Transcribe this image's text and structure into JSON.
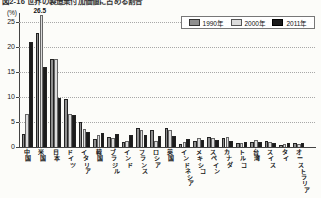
{
  "figure": {
    "title": "図2-16 世界の製造業付加価値に占める割合",
    "unit_label": "(%)"
  },
  "annotation": {
    "text": "26.5",
    "category": "米国",
    "series": "2000年"
  },
  "legend": {
    "items": [
      {
        "label": "1990年",
        "color": "#8f8f8f",
        "border": "#333333"
      },
      {
        "label": "2000年",
        "color": "#dcdcdc",
        "border": "#555555"
      },
      {
        "label": "2011年",
        "color": "#1b1b1b",
        "border": "#000000"
      }
    ]
  },
  "chart_data": {
    "type": "bar",
    "title": "世界の製造業付加価値に占める割合",
    "ylabel": "(%)",
    "ylim": [
      0,
      27.5
    ],
    "y_ticks": [
      0,
      5,
      10,
      15,
      20,
      25
    ],
    "grid": "dotted-horizontal",
    "legend_position": "top-right",
    "categories": [
      "中国",
      "米国",
      "日本",
      "ドイツ",
      "イタリア",
      "韓国",
      "ブラジル",
      "インド",
      "フランス",
      "ロシア",
      "英国",
      "インドネシア",
      "メキシコ",
      "スペイン",
      "カナダ",
      "トルコ",
      "台湾",
      "スイス",
      "タイ",
      "オーストラリア"
    ],
    "series": [
      {
        "name": "1990年",
        "color": "#8f8f8f",
        "values": [
          2.7,
          22.8,
          17.6,
          9.7,
          5.1,
          1.6,
          2.1,
          1.1,
          3.9,
          3.4,
          3.8,
          0.6,
          1.2,
          2.1,
          1.9,
          0.9,
          1.0,
          1.3,
          0.5,
          0.9
        ]
      },
      {
        "name": "2000年",
        "color": "#dcdcdc",
        "values": [
          6.6,
          26.5,
          17.6,
          6.6,
          3.6,
          2.5,
          1.8,
          1.3,
          3.4,
          1.2,
          3.5,
          1.0,
          1.9,
          1.8,
          2.1,
          0.9,
          1.4,
          1.0,
          0.7,
          0.7
        ]
      },
      {
        "name": "2011年",
        "color": "#1b1b1b",
        "values": [
          21.0,
          16.1,
          9.9,
          6.5,
          3.0,
          2.9,
          2.7,
          2.5,
          2.5,
          2.3,
          2.2,
          1.6,
          1.5,
          1.4,
          1.2,
          1.1,
          1.0,
          0.9,
          0.9,
          0.8
        ]
      }
    ]
  }
}
